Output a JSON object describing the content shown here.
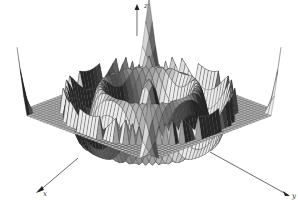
{
  "chart_data": {
    "type": "surface3d",
    "title": "",
    "axes": {
      "x": {
        "label": "x"
      },
      "y": {
        "label": "y"
      },
      "z": {
        "label": "z"
      }
    },
    "grid": false,
    "legend": false,
    "colors": {
      "surface_light": "#c8c8c8",
      "surface_mid": "#9a9a9a",
      "surface_dark": "#3a3a3a",
      "mesh_line": "#2a2a2a",
      "axis": "#444444"
    },
    "surface": {
      "function": "z = cos(r) style concentric ripples with central peak",
      "rings": 3,
      "grid_resolution": 40
    }
  },
  "axis_labels": {
    "x": "x",
    "y": "y",
    "z": "z"
  }
}
